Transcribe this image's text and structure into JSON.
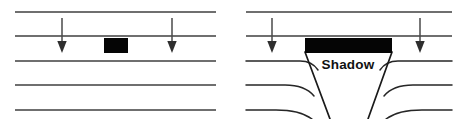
{
  "figure": {
    "width": 466,
    "height": 119,
    "background_color": "#ffffff",
    "line_color": "#3f3f3f",
    "obstacle_color": "#050505",
    "label_color": "#111111"
  },
  "panels": [
    {
      "id": "left-panel",
      "name": "small-obstacle-panel",
      "description": "Straight parallel wavefronts pass an obstacle smaller than the wavelength; no shadow is formed.",
      "x_start": 14,
      "x_end": 216,
      "wavefronts": [
        {
          "index": 1,
          "y": 12,
          "curved": false
        },
        {
          "index": 2,
          "y": 36,
          "curved": false
        },
        {
          "index": 3,
          "y": 61,
          "curved": false
        },
        {
          "index": 4,
          "y": 85,
          "curved": false
        },
        {
          "index": 5,
          "y": 110,
          "curved": false
        }
      ],
      "arrows": [
        {
          "id": "left-panel-arrow-1",
          "x": 62,
          "y_start": 18,
          "y_end": 52
        },
        {
          "id": "left-panel-arrow-2",
          "x": 172,
          "y_start": 18,
          "y_end": 52
        }
      ],
      "obstacle": {
        "name": "small-obstacle",
        "x": 104,
        "y": 38,
        "width": 24,
        "height": 15
      },
      "label": ""
    },
    {
      "id": "right-panel",
      "name": "large-obstacle-panel",
      "description": "Wavefronts meet an obstacle larger than the wavelength; a shadow cone forms behind it and the fronts curve around the edges.",
      "x_start": 246,
      "x_end": 452,
      "wavefronts": [
        {
          "index": 1,
          "y": 12,
          "curved": false
        },
        {
          "index": 2,
          "y": 36,
          "curved": false
        },
        {
          "index": 3,
          "y": 61,
          "curved": true
        },
        {
          "index": 4,
          "y": 85,
          "curved": true
        },
        {
          "index": 5,
          "y": 110,
          "curved": true
        }
      ],
      "arrows": [
        {
          "id": "right-panel-arrow-1",
          "x": 272,
          "y_start": 18,
          "y_end": 52
        },
        {
          "id": "right-panel-arrow-2",
          "x": 420,
          "y_start": 18,
          "y_end": 52
        }
      ],
      "obstacle": {
        "name": "large-obstacle",
        "x": 305,
        "y": 38,
        "width": 87,
        "height": 15
      },
      "shadow_cone": {
        "name": "shadow-cone",
        "apex_left_x": 330,
        "apex_right_x": 368,
        "apex_y": 119,
        "top_left_x": 305,
        "top_right_x": 392,
        "top_y": 52
      },
      "label": "Shadow"
    }
  ],
  "labels": {
    "shadow": "Shadow"
  },
  "icons": {
    "down_arrow": "down-arrow-icon"
  }
}
